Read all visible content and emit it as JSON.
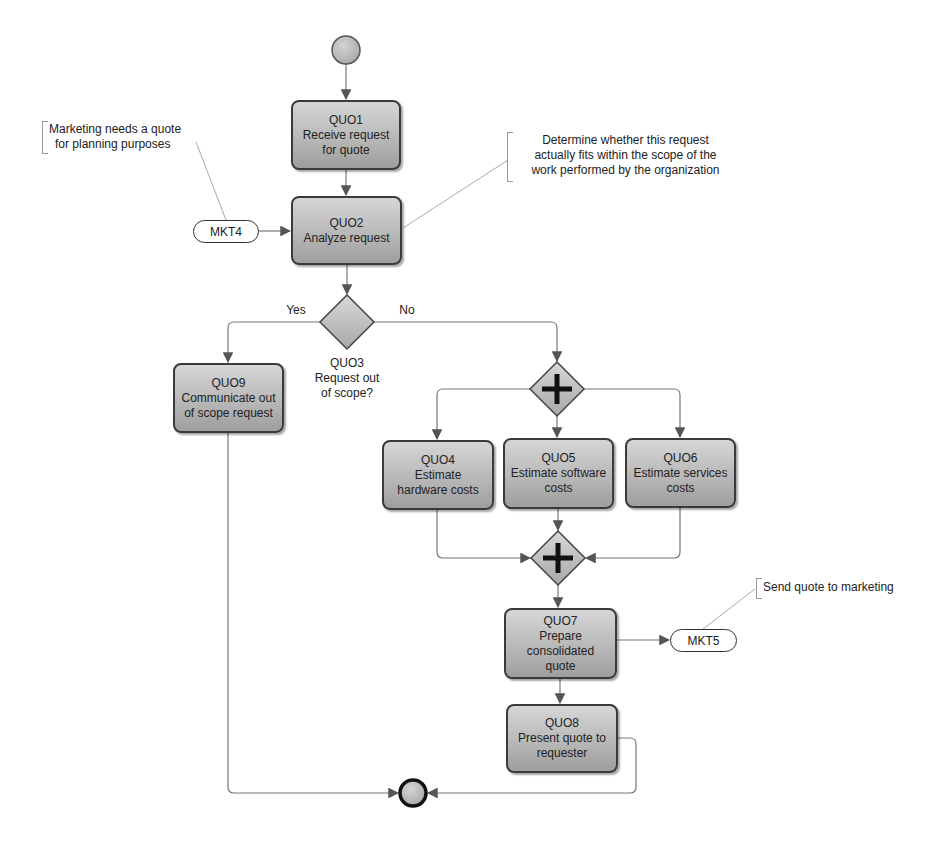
{
  "diagram": {
    "start_event": {
      "label": ""
    },
    "end_event": {
      "label": ""
    },
    "tasks": [
      {
        "id": "QUO1",
        "text": "Receive request for quote",
        "lines": [
          "QUO1",
          "Receive request",
          "for quote"
        ]
      },
      {
        "id": "QUO2",
        "text": "Analyze request",
        "lines": [
          "QUO2",
          "Analyze request"
        ]
      },
      {
        "id": "QUO9",
        "text": "Communicate out of scope request",
        "lines": [
          "QUO9",
          "Communicate out",
          "of scope request"
        ]
      },
      {
        "id": "QUO4",
        "text": "Estimate hardware costs",
        "lines": [
          "QUO4",
          "Estimate",
          "hardware costs"
        ]
      },
      {
        "id": "QUO5",
        "text": "Estimate software costs",
        "lines": [
          "QUO5",
          "Estimate software",
          "costs"
        ]
      },
      {
        "id": "QUO6",
        "text": "Estimate services costs",
        "lines": [
          "QUO6",
          "Estimate services",
          "costs"
        ]
      },
      {
        "id": "QUO7",
        "text": "Prepare consolidated quote",
        "lines": [
          "QUO7",
          "Prepare",
          "consolidated",
          "quote"
        ]
      },
      {
        "id": "QUO8",
        "text": "Present quote to requester",
        "lines": [
          "QUO8",
          "Present quote to",
          "requester"
        ]
      }
    ],
    "decision": {
      "id": "QUO3",
      "lines": [
        "QUO3",
        "Request out",
        "of scope?"
      ],
      "yes_label": "Yes",
      "no_label": "No"
    },
    "gateways": [
      {
        "type": "parallel-split",
        "symbol": "+"
      },
      {
        "type": "parallel-join",
        "symbol": "+"
      }
    ],
    "external_refs": [
      {
        "id": "MKT4",
        "label": "MKT4"
      },
      {
        "id": "MKT5",
        "label": "MKT5"
      }
    ],
    "annotations": [
      {
        "target": "MKT4",
        "lines": [
          "Marketing needs a quote",
          "for planning purposes"
        ]
      },
      {
        "target": "QUO2",
        "lines": [
          "Determine whether this request",
          "actually fits within the scope of the",
          "work performed by the organization"
        ]
      },
      {
        "target": "MKT5",
        "lines": [
          "Send quote to marketing"
        ]
      }
    ],
    "colors": {
      "task_fill": "#b8b8b8",
      "task_border": "#3a3a3a",
      "line": "#777777",
      "annotation_line": "#aaaaaa"
    }
  }
}
